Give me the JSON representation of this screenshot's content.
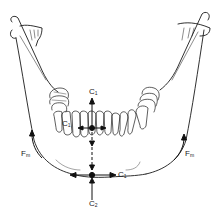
{
  "figure": {
    "line_color": "#1a1a1a",
    "background": "#ffffff"
  },
  "labels": {
    "c1_top": {
      "base": "C",
      "sub": "1"
    },
    "c1_left": {
      "base": "C",
      "sub": "1"
    },
    "c1_right_bottom": {
      "base": "C",
      "sub": "1"
    },
    "c2_bottom": {
      "base": "C",
      "sub": "2"
    },
    "fm_left": {
      "base": "F",
      "sub": "m"
    },
    "fm_right": {
      "base": "F",
      "sub": "m"
    }
  }
}
